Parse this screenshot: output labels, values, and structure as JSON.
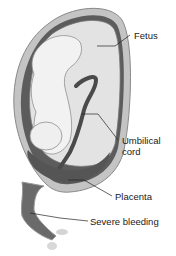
{
  "diagram": {
    "labels": [
      {
        "id": "fetus",
        "text": "Fetus"
      },
      {
        "id": "umbilical-cord",
        "text": "Umbilical cord",
        "lines": [
          "Umbilical",
          "cord"
        ]
      },
      {
        "id": "placenta",
        "text": "Placenta"
      },
      {
        "id": "severe-bleeding",
        "text": "Severe bleeding"
      }
    ],
    "colors": {
      "uterus_wall_outer": "#bdbdbd",
      "uterus_wall_dark": "#5c5c5c",
      "amniotic_sac": "#e3e3e3",
      "fetus": "#f2f2f2",
      "cord": "#4a4a4a",
      "placenta": "#555555",
      "blood": "#6a6a6a",
      "leader_line": "#222222"
    }
  }
}
